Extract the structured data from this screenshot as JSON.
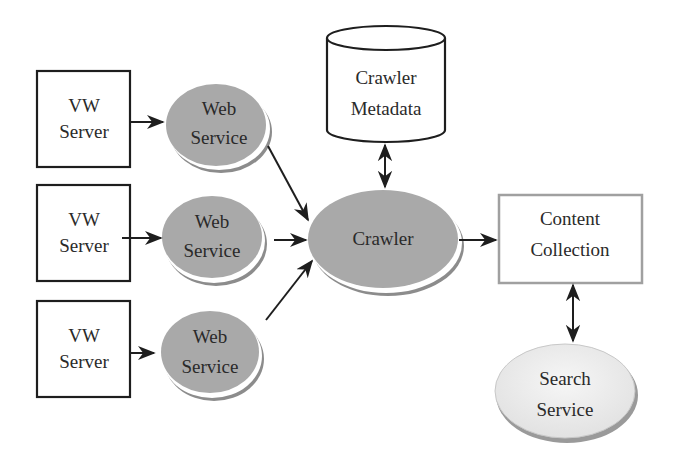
{
  "diagram": {
    "nodes": {
      "vw_server_1": {
        "line1": "VW",
        "line2": "Server"
      },
      "vw_server_2": {
        "line1": "VW",
        "line2": "Server"
      },
      "vw_server_3": {
        "line1": "VW",
        "line2": "Server"
      },
      "web_service_1": {
        "line1": "Web",
        "line2": "Service"
      },
      "web_service_2": {
        "line1": "Web",
        "line2": "Service"
      },
      "web_service_3": {
        "line1": "Web",
        "line2": "Service"
      },
      "crawler": {
        "label": "Crawler"
      },
      "crawler_metadata": {
        "line1": "Crawler",
        "line2": "Metadata"
      },
      "content_collection": {
        "line1": "Content",
        "line2": "Collection"
      },
      "search_service": {
        "line1": "Search",
        "line2": "Service"
      }
    },
    "edges": [
      {
        "from": "VW Server 1",
        "to": "Web Service 1",
        "type": "arrow"
      },
      {
        "from": "VW Server 2",
        "to": "Web Service 2",
        "type": "arrow"
      },
      {
        "from": "VW Server 3",
        "to": "Web Service 3",
        "type": "arrow"
      },
      {
        "from": "Web Service 1",
        "to": "Crawler",
        "type": "arrow"
      },
      {
        "from": "Web Service 2",
        "to": "Crawler",
        "type": "arrow"
      },
      {
        "from": "Web Service 3",
        "to": "Crawler",
        "type": "arrow"
      },
      {
        "from": "Crawler Metadata",
        "to": "Crawler",
        "type": "bidirectional"
      },
      {
        "from": "Crawler",
        "to": "Content Collection",
        "type": "arrow"
      },
      {
        "from": "Content Collection",
        "to": "Search Service",
        "type": "bidirectional"
      }
    ],
    "colors": {
      "service_fill": "#a9a9a9",
      "search_fill": "#ececec",
      "stroke": "#1e1e1e",
      "content_border": "#a0a0a0"
    }
  }
}
